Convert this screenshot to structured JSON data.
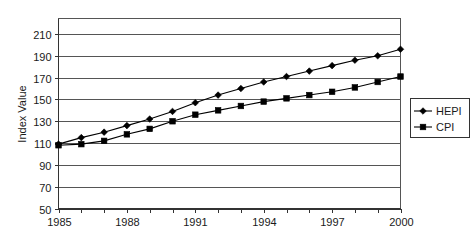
{
  "chart_data": {
    "type": "line",
    "title": "",
    "xlabel": "",
    "ylabel": "Index Value",
    "xlim": [
      1985,
      2000
    ],
    "ylim": [
      50,
      210
    ],
    "ytick_step": 20,
    "xtick_label_step": 3,
    "grid": true,
    "legend_position": "right",
    "x": [
      1985,
      1986,
      1987,
      1988,
      1989,
      1990,
      1991,
      1992,
      1993,
      1994,
      1995,
      1996,
      1997,
      1998,
      1999,
      2000
    ],
    "xtick_labels": [
      "1985",
      "1988",
      "1991",
      "1994",
      "1997",
      "2000"
    ],
    "ytick_labels": [
      "50",
      "70",
      "90",
      "110",
      "130",
      "150",
      "170",
      "190",
      "210"
    ],
    "series": [
      {
        "name": "HEPI",
        "marker": "diamond",
        "color": "#000000",
        "values": [
          109,
          115,
          120,
          126,
          132,
          139,
          147,
          154,
          160,
          166,
          171,
          176,
          181,
          186,
          190,
          196
        ]
      },
      {
        "name": "CPI",
        "marker": "square",
        "color": "#000000",
        "values": [
          108,
          109,
          112,
          118,
          123,
          130,
          136,
          140,
          144,
          148,
          151,
          154,
          157,
          161,
          166,
          171
        ]
      }
    ]
  },
  "legend": {
    "items": [
      {
        "label": "HEPI",
        "marker": "diamond"
      },
      {
        "label": "CPI",
        "marker": "square"
      }
    ]
  },
  "axes": {
    "y_axis_title": "Index Value"
  }
}
